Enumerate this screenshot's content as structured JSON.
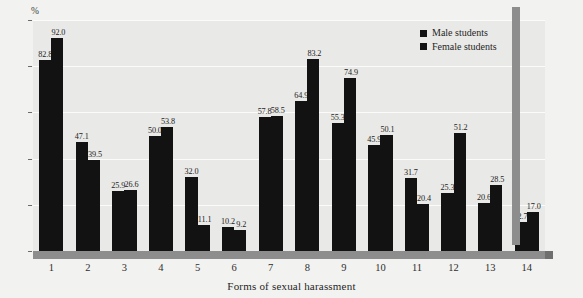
{
  "chart_data": {
    "type": "bar",
    "title": "",
    "xlabel": "Forms of sexual harassment",
    "ylabel": "%",
    "yunit": "%",
    "ylim": [
      0,
      100
    ],
    "yticks": [
      0,
      20,
      40,
      60,
      80,
      100
    ],
    "grid": true,
    "legend_position": "top-right",
    "categories": [
      "1",
      "2",
      "3",
      "4",
      "5",
      "6",
      "7",
      "8",
      "9",
      "10",
      "11",
      "12",
      "13",
      "14"
    ],
    "series": [
      {
        "name": "Male students",
        "color": "#121212",
        "values": [
          82.8,
          47.1,
          25.9,
          50.0,
          32.0,
          10.2,
          57.8,
          64.9,
          55.3,
          45.9,
          31.7,
          25.3,
          20.6,
          12.7
        ]
      },
      {
        "name": "Female students",
        "color": "#121212",
        "values": [
          92.0,
          39.5,
          26.6,
          53.8,
          11.1,
          9.2,
          58.5,
          83.2,
          74.9,
          50.1,
          20.4,
          51.2,
          28.5,
          17.0
        ]
      }
    ]
  }
}
